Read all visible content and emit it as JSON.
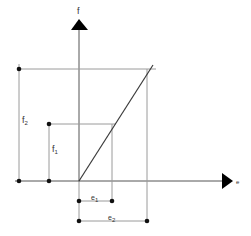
{
  "diagram": {
    "type": "linear force-extension relation",
    "axes": {
      "vertical": {
        "label": "f"
      },
      "horizontal": {
        "label": "e"
      }
    },
    "annotations": {
      "f1": {
        "main": "f",
        "sub": "1"
      },
      "f2": {
        "main": "f",
        "sub": "2"
      },
      "e1": {
        "main": "e",
        "sub": "1"
      },
      "e2": {
        "main": "e",
        "sub": "2"
      }
    },
    "colors": {
      "axis": "#555555",
      "guide": "#9a9a9a",
      "line": "#3a3a3a",
      "marker": "#111111"
    }
  }
}
